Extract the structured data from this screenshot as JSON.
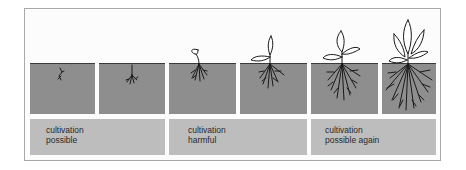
{
  "diagram": {
    "stages": [
      {
        "id": 1,
        "stage": "germinating seed"
      },
      {
        "id": 2,
        "stage": "root emerging"
      },
      {
        "id": 3,
        "stage": "seedling with cotyledon"
      },
      {
        "id": 4,
        "stage": "two-leaf seedling"
      },
      {
        "id": 5,
        "stage": "young plant"
      },
      {
        "id": 6,
        "stage": "established plant"
      }
    ],
    "labels": [
      {
        "line1": "cultivation",
        "line2": "possible"
      },
      {
        "line1": "cultivation",
        "line2": "harmful"
      },
      {
        "line1": "cultivation",
        "line2": "possible again"
      }
    ],
    "colors": {
      "soil": "#8e8e8e",
      "label_band": "#bdbdbd",
      "frame_border": "#a8a8a8",
      "ink": "#1a1a1a"
    }
  }
}
